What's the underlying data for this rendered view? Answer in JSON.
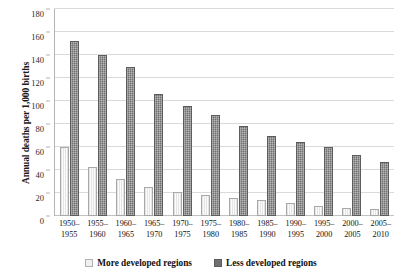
{
  "chart_data": {
    "type": "bar",
    "title": "",
    "xlabel": "",
    "ylabel": "Annual deaths per 1,000 births",
    "ylim": [
      0,
      180
    ],
    "ytick_step": 20,
    "yticks": [
      180,
      160,
      140,
      120,
      100,
      80,
      60,
      40,
      20,
      0
    ],
    "grid": true,
    "legend_position": "bottom",
    "categories": [
      "1950–1955",
      "1955–1960",
      "1960–1965",
      "1965–1970",
      "1970–1975",
      "1975–1980",
      "1980–1985",
      "1985–1990",
      "1990–1995",
      "1995–2000",
      "2000–2005",
      "2005–2010"
    ],
    "category_lines": [
      [
        "1950–",
        "1955"
      ],
      [
        "1955–",
        "1960"
      ],
      [
        "1960–",
        "1965"
      ],
      [
        "1965–",
        "1970"
      ],
      [
        "1970–",
        "1975"
      ],
      [
        "1975–",
        "1980"
      ],
      [
        "1980–",
        "1985"
      ],
      [
        "1985–",
        "1990"
      ],
      [
        "1990–",
        "1995"
      ],
      [
        "1995–",
        "2000"
      ],
      [
        "2000–",
        "2005"
      ],
      [
        "2005–",
        "2010"
      ]
    ],
    "series": [
      {
        "name": "More developed regions",
        "color": "#f0f0f0",
        "values": [
          60,
          43,
          32,
          25,
          21,
          18,
          16,
          14,
          11,
          9,
          7,
          6
        ]
      },
      {
        "name": "Less developed regions",
        "color": "#6f6f6f",
        "values": [
          152,
          140,
          130,
          106,
          96,
          88,
          78,
          70,
          64,
          60,
          53,
          47
        ]
      }
    ]
  },
  "legend": {
    "items": [
      {
        "label": "More developed regions"
      },
      {
        "label": "Less developed regions"
      }
    ]
  }
}
